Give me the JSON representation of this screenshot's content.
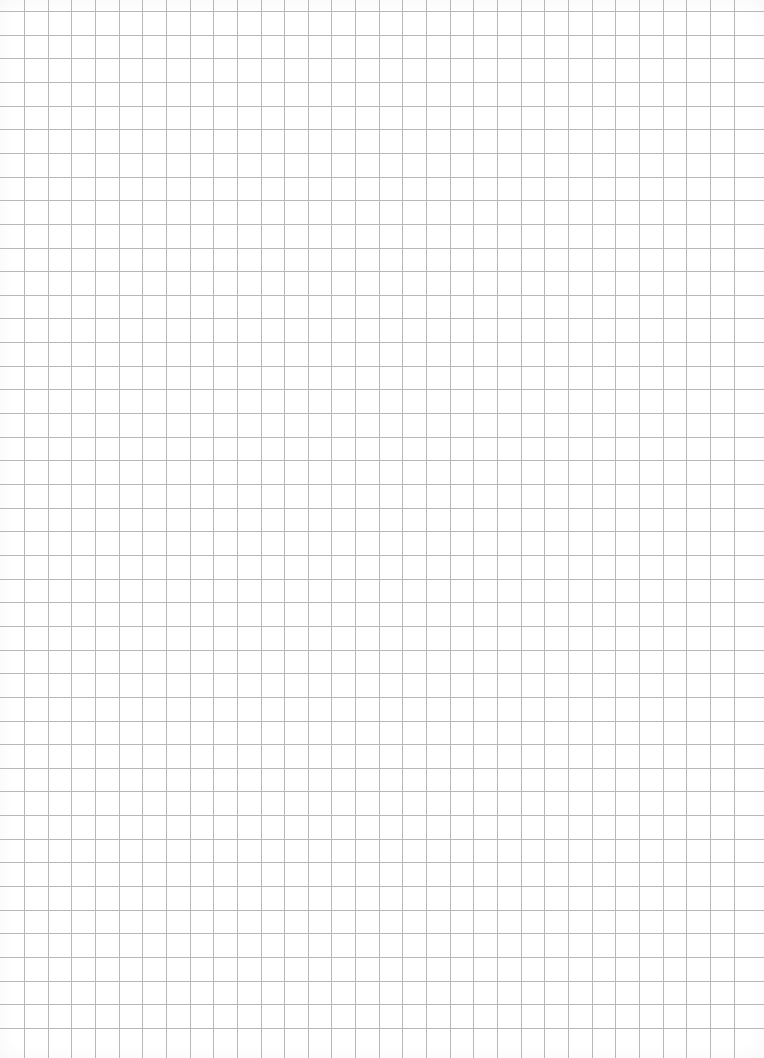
{
  "page": {
    "type": "grid-paper",
    "background_color": "#ffffff",
    "grid": {
      "line_color": "#b8b8b8",
      "spacing_px": 23.65,
      "origin_x": 24,
      "origin_y": 11,
      "vertical_lines": 31,
      "horizontal_lines": 44
    }
  }
}
